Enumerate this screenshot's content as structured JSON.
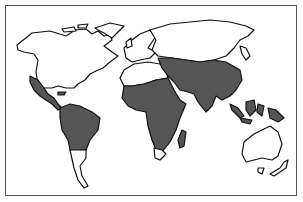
{
  "map": {
    "type": "world-map",
    "legend": [],
    "colors": {
      "background": "#ffffff",
      "land": "#ffffff",
      "highlighted": "#555555",
      "outline": "#111111",
      "frame": "#555555"
    },
    "highlighted_regions": [
      "Mexico",
      "Central America",
      "Caribbean",
      "Northern and central South America",
      "Sub-Saharan Africa",
      "Madagascar",
      "Middle East",
      "South Asia",
      "Southeast Asia",
      "Southern China",
      "Indonesia",
      "Philippines",
      "New Guinea"
    ],
    "unhighlighted_regions": [
      "North America (US, Canada)",
      "Greenland",
      "Europe",
      "Russia",
      "North Africa",
      "Southern Africa tip",
      "Southern South America",
      "Australia",
      "New Zealand",
      "Japan"
    ]
  }
}
